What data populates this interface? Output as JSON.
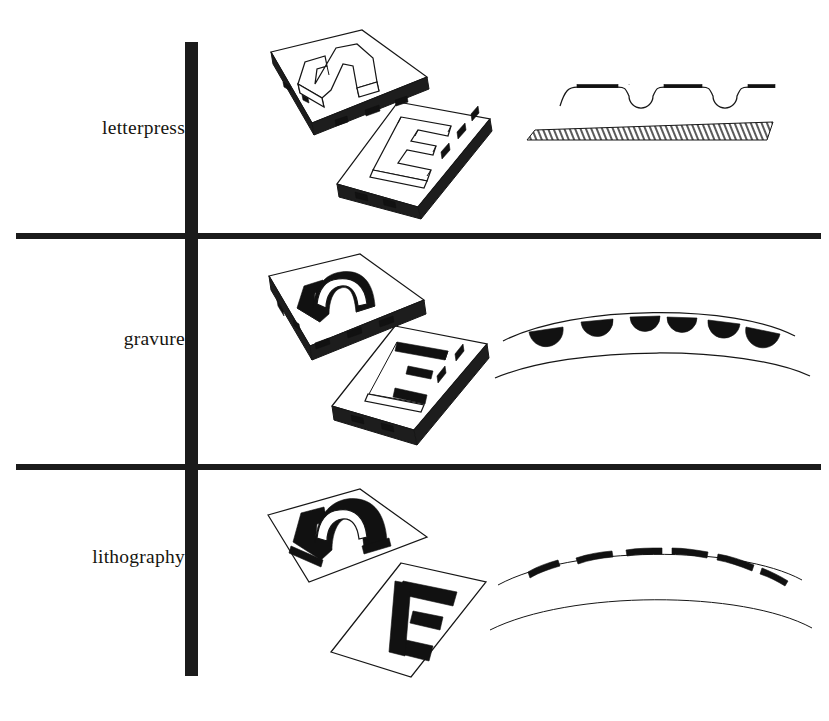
{
  "figure": {
    "background_color": "#ffffff",
    "ink_color": "#161616",
    "rule_color": "#1b1b1b"
  },
  "rows": [
    {
      "label": "letterpress",
      "plate_illustration": {
        "name": "relief-plates-illustration",
        "description": "two isometric printing plates with raised letterforms",
        "letterforms": [
          "n",
          "E"
        ],
        "relief_type": "raised"
      },
      "cross_section": {
        "name": "letterpress-cross-section",
        "description": "paper sheet pressed into relief type above a hatched type block",
        "ink_segments": 4,
        "dips": 3,
        "has_hatched_block": true,
        "paper_profile": "stepped"
      }
    },
    {
      "label": "gravure",
      "plate_illustration": {
        "name": "intaglio-plates-illustration",
        "description": "two isometric printing plates with engraved recessed letterforms",
        "letterforms": [
          "n",
          "E"
        ],
        "relief_type": "recessed"
      },
      "cross_section": {
        "name": "gravure-cross-section",
        "description": "curved paper with ink blobs transferred from engraved cells, second curve below",
        "ink_blobs": 6,
        "curves": 2,
        "paper_profile": "curved"
      }
    },
    {
      "label": "lithography",
      "plate_illustration": {
        "name": "planographic-plates-illustration",
        "description": "two flat sheets with flat solid letterforms",
        "letterforms": [
          "n",
          "E"
        ],
        "relief_type": "flat"
      },
      "cross_section": {
        "name": "lithography-cross-section",
        "description": "curved paper with flat ink dashes lying on the surface, second curve below",
        "ink_dashes": 6,
        "curves": 2,
        "paper_profile": "curved"
      }
    }
  ]
}
